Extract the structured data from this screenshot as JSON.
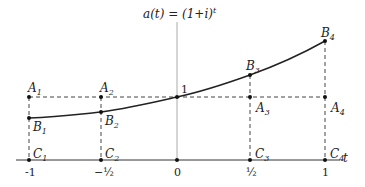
{
  "axes": {
    "x_label": "t",
    "ticks": [
      "-1",
      "−½",
      "0",
      "½",
      "1"
    ],
    "origin_value_label": "1"
  },
  "points": {
    "A": [
      "A1",
      "A2",
      "A3",
      "A4"
    ],
    "B": [
      "B1",
      "B2",
      "B3",
      "B4"
    ],
    "C": [
      "C1",
      "C2",
      "C3",
      "C4"
    ]
  },
  "colors": {
    "curve": "#222222",
    "axis": "#333333",
    "y_axis": "#aaaaaa",
    "dashed": "#444444"
  }
}
